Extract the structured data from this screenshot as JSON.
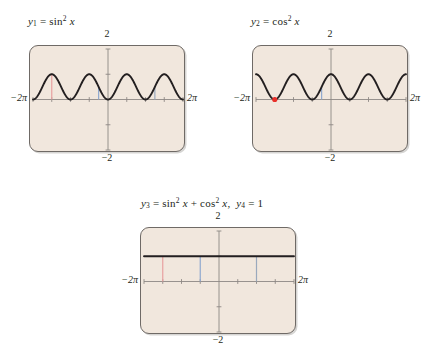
{
  "figure": {
    "background": "#ffffff",
    "screen_fill": "#f1e7dd",
    "screen_border": "#6f6a66",
    "curve_color": "#231f20",
    "axis_color": "#8d8885",
    "marker_red": "#e8a0a0",
    "marker_blue": "#8fa8cf",
    "dot_red": "#e8302a"
  },
  "panels": [
    {
      "id": "panel-1",
      "title_parts": {
        "y": "y",
        "sub": "1",
        "eq": "=",
        "fn": "sin",
        "sup": "2",
        "var": "x"
      },
      "title_text": "y₁ = sin² x",
      "labels": {
        "top": "2",
        "bottom": "−2",
        "left": "−2π",
        "right": "2π"
      }
    },
    {
      "id": "panel-2",
      "title_parts": {
        "y": "y",
        "sub": "2",
        "eq": "=",
        "fn": "cos",
        "sup": "2",
        "var": "x"
      },
      "title_text": "y₂ = cos² x",
      "labels": {
        "top": "2",
        "bottom": "−2",
        "left": "−2π",
        "right": "2π"
      }
    },
    {
      "id": "panel-3",
      "title_text": "y₃ = sin² x + cos² x,  y₄ = 1",
      "labels": {
        "top": "2",
        "bottom": "−2",
        "left": "−2π",
        "right": "2π"
      }
    }
  ],
  "chart_data": [
    {
      "type": "line",
      "id": "panel-1",
      "title": "y₁ = sin² x",
      "function": "y = sin^2(x)",
      "xlabel": "x",
      "ylabel": "y",
      "xlim": [
        -6.283185,
        6.283185
      ],
      "ylim": [
        -2,
        2
      ],
      "xtick_labels": [
        "−2π",
        "2π"
      ],
      "ytick_labels": [
        "2",
        "−2"
      ],
      "xticks": [
        -6.283185,
        -4.712389,
        -3.141593,
        -1.570796,
        0,
        1.570796,
        3.141593,
        4.712389,
        6.283185
      ],
      "yticks": [
        -2,
        -1,
        0,
        1,
        2
      ],
      "grid": false,
      "legend": "none",
      "x": [
        -6.283185,
        -5.890486,
        -5.497787,
        -5.105088,
        -4.712389,
        -4.31969,
        -3.926991,
        -3.534292,
        -3.141593,
        -2.748894,
        -2.356194,
        -1.963495,
        -1.570796,
        -1.178097,
        -0.785398,
        -0.392699,
        0,
        0.392699,
        0.785398,
        1.178097,
        1.570796,
        1.963495,
        2.356194,
        2.748894,
        3.141593,
        3.534292,
        3.926991,
        4.31969,
        4.712389,
        5.105088,
        5.497787,
        5.890486,
        6.283185
      ],
      "y": [
        0,
        0.1464,
        0.5,
        0.8536,
        1,
        0.8536,
        0.5,
        0.1464,
        0,
        0.1464,
        0.5,
        0.8536,
        1,
        0.8536,
        0.5,
        0.1464,
        0,
        0.1464,
        0.5,
        0.8536,
        1,
        0.8536,
        0.5,
        0.1464,
        0,
        0.1464,
        0.5,
        0.8536,
        1,
        0.8536,
        0.5,
        0.1464,
        0
      ],
      "annotations": [
        {
          "kind": "vertical-segment",
          "color": "#e8a0a0",
          "x": -4.712389,
          "y0": 0,
          "y1": 1
        },
        {
          "kind": "vertical-segment",
          "color": "#8fa8cf",
          "x": -0.785398,
          "y0": 0,
          "y1": 0.5
        },
        {
          "kind": "vertical-segment",
          "color": "#9aa9bd",
          "x": 3.926991,
          "y0": 0,
          "y1": 0.5
        }
      ]
    },
    {
      "type": "line",
      "id": "panel-2",
      "title": "y₂ = cos² x",
      "function": "y = cos^2(x)",
      "xlabel": "x",
      "ylabel": "y",
      "xlim": [
        -6.283185,
        6.283185
      ],
      "ylim": [
        -2,
        2
      ],
      "xtick_labels": [
        "−2π",
        "2π"
      ],
      "ytick_labels": [
        "2",
        "−2"
      ],
      "xticks": [
        -6.283185,
        -4.712389,
        -3.141593,
        -1.570796,
        0,
        1.570796,
        3.141593,
        4.712389,
        6.283185
      ],
      "yticks": [
        -2,
        -1,
        0,
        1,
        2
      ],
      "grid": false,
      "legend": "none",
      "x": [
        -6.283185,
        -5.890486,
        -5.497787,
        -5.105088,
        -4.712389,
        -4.31969,
        -3.926991,
        -3.534292,
        -3.141593,
        -2.748894,
        -2.356194,
        -1.963495,
        -1.570796,
        -1.178097,
        -0.785398,
        -0.392699,
        0,
        0.392699,
        0.785398,
        1.178097,
        1.570796,
        1.963495,
        2.356194,
        2.748894,
        3.141593,
        3.534292,
        3.926991,
        4.31969,
        4.712389,
        5.105088,
        5.497787,
        5.890486,
        6.283185
      ],
      "y": [
        1,
        0.8536,
        0.5,
        0.1464,
        0,
        0.1464,
        0.5,
        0.8536,
        1,
        0.8536,
        0.5,
        0.1464,
        0,
        0.1464,
        0.5,
        0.8536,
        1,
        0.8536,
        0.5,
        0.1464,
        0,
        0.1464,
        0.5,
        0.8536,
        1,
        0.8536,
        0.5,
        0.1464,
        0,
        0.1464,
        0.5,
        0.8536,
        1
      ],
      "annotations": [
        {
          "kind": "point",
          "color": "#e8302a",
          "x": -4.712389,
          "y": 0
        },
        {
          "kind": "vertical-segment",
          "color": "#8fa8cf",
          "x": -0.785398,
          "y0": 0,
          "y1": 0.5
        }
      ]
    },
    {
      "type": "line",
      "id": "panel-3",
      "title": "y₃ = sin² x + cos² x,  y₄ = 1",
      "function": "y = sin^2(x) + cos^2(x) = 1",
      "xlabel": "x",
      "ylabel": "y",
      "xlim": [
        -6.283185,
        6.283185
      ],
      "ylim": [
        -2,
        2
      ],
      "xtick_labels": [
        "−2π",
        "2π"
      ],
      "ytick_labels": [
        "2",
        "−2"
      ],
      "xticks": [
        -6.283185,
        -4.712389,
        -3.141593,
        -1.570796,
        0,
        1.570796,
        3.141593,
        4.712389,
        6.283185
      ],
      "yticks": [
        -2,
        -1,
        0,
        1,
        2
      ],
      "grid": false,
      "legend": "none",
      "x": [
        -6.283185,
        6.283185
      ],
      "y": [
        1,
        1
      ],
      "annotations": [
        {
          "kind": "vertical-segment",
          "color": "#e8a0a0",
          "x": -4.712389,
          "y0": 0,
          "y1": 1
        },
        {
          "kind": "vertical-segment",
          "color": "#8fa8cf",
          "x": -1.570796,
          "y0": 0,
          "y1": 1
        },
        {
          "kind": "vertical-segment",
          "color": "#9aa9bd",
          "x": 3.141593,
          "y0": 0,
          "y1": 1
        }
      ]
    }
  ]
}
